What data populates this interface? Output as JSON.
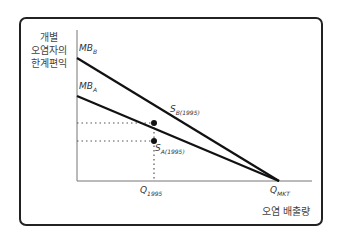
{
  "diagram": {
    "y_axis_label_lines": [
      "개별",
      "오염자의",
      "한계편익"
    ],
    "x_axis_label": "오염 배출량",
    "curves": [
      {
        "name": "MB",
        "subscript": "B"
      },
      {
        "name": "MB",
        "subscript": "A"
      }
    ],
    "points": [
      {
        "name": "S",
        "subscript": "B(1995)"
      },
      {
        "name": "S",
        "subscript": "A(1995)"
      }
    ],
    "x_ticks": [
      {
        "name": "Q",
        "subscript": "1995"
      },
      {
        "name": "Q",
        "subscript": "MKT"
      }
    ]
  }
}
